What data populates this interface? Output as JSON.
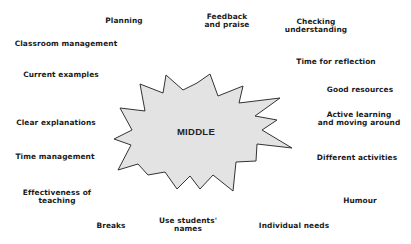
{
  "diagram": {
    "type": "mind-map",
    "center": {
      "label": "MIDDLE",
      "shape": "starburst",
      "fill": "#e3e3e3",
      "stroke": "#333333"
    },
    "items": [
      {
        "label": "Planning",
        "x": 124,
        "y": 17
      },
      {
        "label": "Feedback\nand praise",
        "x": 227,
        "y": 13
      },
      {
        "label": "Checking\nunderstanding",
        "x": 316,
        "y": 18
      },
      {
        "label": "Classroom management",
        "x": 66,
        "y": 40
      },
      {
        "label": "Current examples",
        "x": 61,
        "y": 71
      },
      {
        "label": "Time for reflection",
        "x": 336,
        "y": 58
      },
      {
        "label": "Good resources",
        "x": 360,
        "y": 86
      },
      {
        "label": "Clear explanations",
        "x": 56,
        "y": 119
      },
      {
        "label": "Active learning\nand moving around",
        "x": 359,
        "y": 111
      },
      {
        "label": "Time management",
        "x": 55,
        "y": 153
      },
      {
        "label": "Different activities",
        "x": 357,
        "y": 154
      },
      {
        "label": "Effectiveness of\nteaching",
        "x": 57,
        "y": 189
      },
      {
        "label": "Humour",
        "x": 360,
        "y": 197
      },
      {
        "label": "Breaks",
        "x": 111,
        "y": 222
      },
      {
        "label": "Use students'\nnames",
        "x": 188,
        "y": 217
      },
      {
        "label": "Individual needs",
        "x": 294,
        "y": 222
      }
    ]
  }
}
